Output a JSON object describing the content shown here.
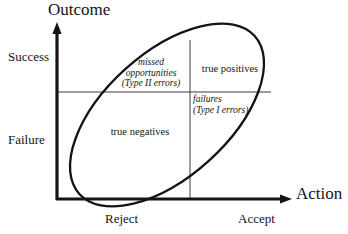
{
  "figure": {
    "kind": "signal-detection 2x2 outcome-by-action matrix with correlation ellipse",
    "background_color": "#ffffff",
    "line_color": "#141414",
    "axes": {
      "y_axis_title": "Outcome",
      "x_axis_title": "Action",
      "y_tick_labels": [
        "Success",
        "Failure"
      ],
      "x_tick_labels": [
        "Reject",
        "Accept"
      ]
    },
    "quadrants": [
      {
        "id": "missed-opportunities",
        "outcome": "Success",
        "action": "Reject",
        "style": "italic",
        "lines": [
          "missed",
          "opportunities",
          "(Type II errors)"
        ]
      },
      {
        "id": "true-positives",
        "outcome": "Success",
        "action": "Accept",
        "style": "roman",
        "lines": [
          "true positives"
        ]
      },
      {
        "id": "failures",
        "outcome": "Failure",
        "action": "Accept",
        "style": "italic",
        "lines": [
          "failures",
          "(Type I errors)"
        ]
      },
      {
        "id": "true-negatives",
        "outcome": "Failure",
        "action": "Reject",
        "style": "roman",
        "lines": [
          "true negatives"
        ]
      }
    ],
    "ellipse": {
      "center_x": 167,
      "center_y": 115,
      "radius_x": 118,
      "radius_y": 62,
      "rotation_deg": -42
    },
    "geometry": {
      "y_axis_x": 57,
      "x_axis_y": 199,
      "y_axis_top": 25,
      "x_axis_right": 292,
      "divider_vertical_x": 190,
      "divider_vertical_top": 40,
      "divider_horizontal_y": 92,
      "divider_horizontal_right": 271
    }
  }
}
